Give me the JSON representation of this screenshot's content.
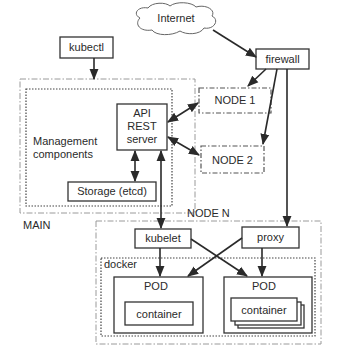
{
  "diagram": {
    "type": "kubernetes-architecture",
    "nodes": {
      "internet": {
        "label": "Internet",
        "shape": "cloud"
      },
      "kubectl": {
        "label": "kubectl"
      },
      "firewall": {
        "label": "firewall"
      },
      "main": {
        "label": "MAIN",
        "style": "dash-dot"
      },
      "management": {
        "label_line1": "Management",
        "label_line2": "components",
        "style": "dotted"
      },
      "api": {
        "line1": "API",
        "line2": "REST",
        "line3": "server"
      },
      "storage": {
        "label": "Storage (etcd)"
      },
      "node1": {
        "label": "NODE 1",
        "style": "dash-dot"
      },
      "node2": {
        "label": "NODE 2",
        "style": "dash-dot"
      },
      "noden": {
        "label": "NODE N",
        "style": "dash-dot"
      },
      "kubelet": {
        "label": "kubelet"
      },
      "proxy": {
        "label": "proxy"
      },
      "docker": {
        "label": "docker",
        "style": "dotted"
      },
      "pod_left": {
        "label": "POD",
        "container": "container"
      },
      "pod_right": {
        "label": "POD",
        "container": "container",
        "stacked": true
      }
    },
    "edges": [
      {
        "from": "Internet",
        "to": "firewall",
        "direction": "forward"
      },
      {
        "from": "kubectl",
        "to": "MAIN",
        "direction": "forward"
      },
      {
        "from": "firewall",
        "to": "NODE 1",
        "direction": "forward"
      },
      {
        "from": "firewall",
        "to": "NODE 2",
        "direction": "forward"
      },
      {
        "from": "firewall",
        "to": "proxy",
        "direction": "forward"
      },
      {
        "from": "API REST server",
        "to": "NODE 1",
        "direction": "both"
      },
      {
        "from": "API REST server",
        "to": "NODE 2",
        "direction": "both"
      },
      {
        "from": "API REST server",
        "to": "Storage (etcd)",
        "direction": "both"
      },
      {
        "from": "API REST server",
        "to": "kubelet",
        "direction": "both"
      },
      {
        "from": "kubelet",
        "to": "POD (left)",
        "direction": "forward"
      },
      {
        "from": "kubelet",
        "to": "POD (right)",
        "direction": "forward"
      },
      {
        "from": "proxy",
        "to": "POD (left)",
        "direction": "forward"
      },
      {
        "from": "proxy",
        "to": "POD (right)",
        "direction": "forward"
      }
    ],
    "colors": {
      "stroke": "#333333",
      "group_border": "#9a9a9a",
      "background": "#ffffff"
    }
  }
}
